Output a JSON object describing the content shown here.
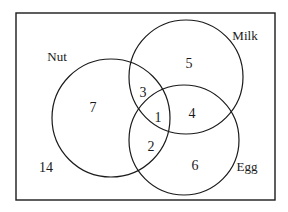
{
  "diagram": {
    "type": "venn-3",
    "universe": {
      "outside_count": "14"
    },
    "sets": [
      {
        "key": "nut",
        "label": "Nut",
        "cx": 111,
        "cy": 118,
        "r": 59,
        "label_x": 57,
        "label_y": 61
      },
      {
        "key": "milk",
        "label": "Milk",
        "cx": 186,
        "cy": 77,
        "r": 57,
        "label_x": 245,
        "label_y": 40
      },
      {
        "key": "egg",
        "label": "Egg",
        "cx": 184,
        "cy": 140,
        "r": 55,
        "label_x": 247,
        "label_y": 171
      }
    ],
    "regions": [
      {
        "name": "nut-only",
        "value": "7",
        "x": 93,
        "y": 112
      },
      {
        "name": "milk-only",
        "value": "5",
        "x": 189,
        "y": 68
      },
      {
        "name": "egg-only",
        "value": "6",
        "x": 195,
        "y": 170
      },
      {
        "name": "nut-milk-only",
        "value": "3",
        "x": 143,
        "y": 97
      },
      {
        "name": "nut-egg-only",
        "value": "2",
        "x": 151,
        "y": 151
      },
      {
        "name": "milk-egg-only",
        "value": "4",
        "x": 192,
        "y": 118
      },
      {
        "name": "all-three",
        "value": "1",
        "x": 158,
        "y": 122
      },
      {
        "name": "outside",
        "value": "14",
        "x": 46,
        "y": 172
      }
    ],
    "colors": {
      "stroke": "#1a1a1a",
      "background": "#ffffff"
    }
  }
}
